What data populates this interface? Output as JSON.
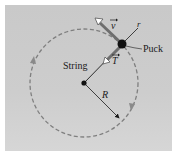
{
  "diagram": {
    "labels": {
      "string": "String",
      "puck": "Puck",
      "radius": "R",
      "r_axis": "r",
      "velocity": "v",
      "tension": "T"
    },
    "geometry": {
      "center": [
        84,
        83
      ],
      "radius": 54,
      "puck": [
        122,
        44
      ]
    },
    "colors": {
      "background": "#cbcbcb",
      "path": "#808080",
      "ink": "#1a1a1a"
    }
  }
}
